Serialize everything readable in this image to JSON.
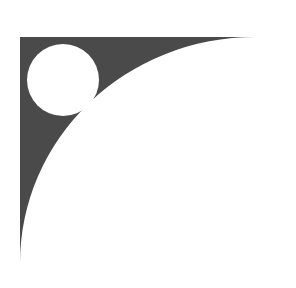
{
  "figure": {
    "colors": {
      "fill": "#4a4a4a",
      "background": "#ffffff",
      "cutout": "#ffffff"
    },
    "shape": {
      "corner": [
        20,
        37
      ],
      "top_tip": [
        255,
        37
      ],
      "bottom_tip": [
        20,
        263
      ],
      "arc_radius_x": 235,
      "arc_radius_y": 226
    },
    "circle": {
      "cx": 63,
      "cy": 80,
      "r": 36
    }
  }
}
